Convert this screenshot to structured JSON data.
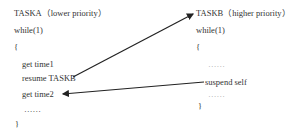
{
  "diagram": {
    "task_a": {
      "title": "TASKA（lower priority）",
      "lines": [
        "while(1)",
        "{",
        "get time1",
        "resume TASKB",
        "get time2",
        "……",
        "}"
      ]
    },
    "task_b": {
      "title": "TASKB（higher priority）",
      "lines": [
        "while(1)",
        "{",
        "……",
        "suspend self",
        "……",
        "}"
      ]
    },
    "arrows": [
      {
        "from": "resume TASKB",
        "to": "TASKB（higher priority）"
      },
      {
        "from": "suspend self",
        "to": "get time2"
      }
    ],
    "colors": {
      "text": "#333333",
      "arrow": "#222222"
    }
  }
}
